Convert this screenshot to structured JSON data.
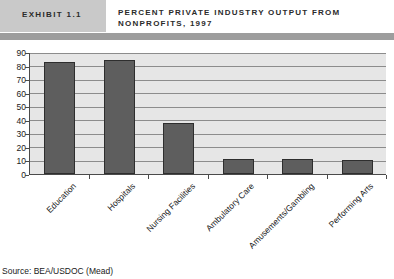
{
  "header": {
    "exhibit_label": "EXHIBIT 1.1",
    "title": "PERCENT PRIVATE INDUSTRY OUTPUT FROM NONPROFITS, 1997",
    "accent_color": "#c9c9c9",
    "rule_color": "#9d9d9d"
  },
  "footer": {
    "source": "Source: BEA/USDOC (Mead)"
  },
  "chart_data": {
    "type": "bar",
    "title": "PERCENT PRIVATE INDUSTRY OUTPUT FROM NONPROFITS, 1997",
    "xlabel": "",
    "ylabel": "",
    "categories": [
      "Education",
      "Hospitals",
      "Nursing Facilities",
      "Ambulatory Care",
      "Amusements/Gambling",
      "Performing Arts"
    ],
    "values": [
      83,
      84,
      38,
      11,
      11,
      10
    ],
    "ylim": [
      0,
      90
    ],
    "yticks": [
      0,
      10,
      20,
      30,
      40,
      50,
      60,
      70,
      80,
      90
    ],
    "grid": true,
    "legend": false,
    "bar_color": "#5e5e5e",
    "plot_background": "#e6e6e6",
    "gridline_color": "#8c8c8c"
  }
}
